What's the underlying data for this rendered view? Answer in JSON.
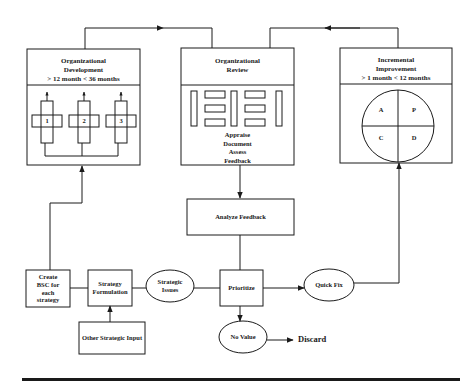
{
  "diagram": {
    "org_development": {
      "title": "Organizational",
      "title2": "Development",
      "duration": "> 12 month < 36 months",
      "initiatives": [
        "1",
        "2",
        "3"
      ]
    },
    "org_review": {
      "title": "Organizational",
      "title2": "Review",
      "activities": [
        "Appraise",
        "Document",
        "Assess",
        "Feedback"
      ]
    },
    "incremental_improvement": {
      "title": "Incremental",
      "title2": "Improvement",
      "duration": "> 1 month < 12 months",
      "pdca": [
        "A",
        "P",
        "C",
        "D"
      ]
    },
    "nodes": {
      "analyze_feedback": "Analyze Feedback",
      "create_bsc": [
        "Create",
        "BSC for",
        "each",
        "strategy"
      ],
      "strategy_formulation": [
        "Strategy",
        "Formulation"
      ],
      "strategic_issues": [
        "Strategic",
        "Issues"
      ],
      "prioritize": "Prioritize",
      "quick_fix": "Quick Fix",
      "no_value": "No Value",
      "discard": "Discard",
      "other_strategic_input": "Other Strategic Input"
    },
    "colors": {
      "line": "#1a1a1a",
      "background": "#ffffff"
    }
  }
}
